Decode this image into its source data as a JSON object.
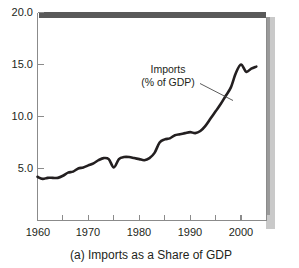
{
  "figure": {
    "caption": "(a) Imports as a Share of GDP",
    "annotation_line1": "Imports",
    "annotation_line2": "(% of GDP)",
    "accent_color": "#231f20",
    "axis_color": "#8b8b8b",
    "top_bar_color": "#595959",
    "shadow_color": "#c9c9c9"
  },
  "chart_data": {
    "type": "line",
    "title": "",
    "subtitle": "",
    "caption": "(a) Imports as a Share of GDP",
    "xlabel": "",
    "ylabel": "",
    "ylim": [
      0,
      20
    ],
    "xlim": [
      1960,
      2005
    ],
    "grid": false,
    "legend_position": "inline-annotation",
    "annotations": [
      {
        "text": "Imports (% of GDP)",
        "line1": "Imports",
        "line2": "(% of GDP)",
        "x": 1989,
        "y": 16.5,
        "leader_to_x": 1996,
        "leader_to_y": 12.6
      }
    ],
    "y_ticks": [
      5.0,
      10.0,
      15.0,
      20.0
    ],
    "y_tick_labels": [
      "5.0",
      "10.0",
      "15.0",
      "20.0"
    ],
    "x_ticks": [
      1960,
      1965,
      1970,
      1975,
      1980,
      1985,
      1990,
      1995,
      2000,
      2005
    ],
    "x_tick_labels_major": [
      "1960",
      "1970",
      "1980",
      "1990",
      "2000"
    ],
    "x_ticks_major": [
      1960,
      1970,
      1980,
      1990,
      2000
    ],
    "series": [
      {
        "name": "Imports (% of GDP)",
        "color": "#231f20",
        "x": [
          1960,
          1961,
          1962,
          1963,
          1964,
          1965,
          1966,
          1967,
          1968,
          1969,
          1970,
          1971,
          1972,
          1973,
          1974,
          1975,
          1976,
          1977,
          1978,
          1979,
          1980,
          1981,
          1982,
          1983,
          1984,
          1985,
          1986,
          1987,
          1988,
          1989,
          1990,
          1991,
          1992,
          1993,
          1994,
          1995,
          1996,
          1997,
          1998,
          1999,
          2000,
          2001,
          2002,
          2003
        ],
        "values": [
          4.2,
          4.0,
          4.1,
          4.1,
          4.1,
          4.3,
          4.6,
          4.7,
          5.0,
          5.1,
          5.3,
          5.5,
          5.8,
          6.0,
          5.9,
          5.1,
          5.9,
          6.1,
          6.1,
          6.0,
          5.9,
          5.8,
          6.0,
          6.5,
          7.5,
          7.8,
          7.9,
          8.2,
          8.3,
          8.4,
          8.5,
          8.4,
          8.6,
          9.1,
          9.8,
          10.5,
          11.2,
          12.0,
          12.8,
          14.2,
          15.0,
          14.3,
          14.6,
          14.8
        ]
      }
    ]
  }
}
